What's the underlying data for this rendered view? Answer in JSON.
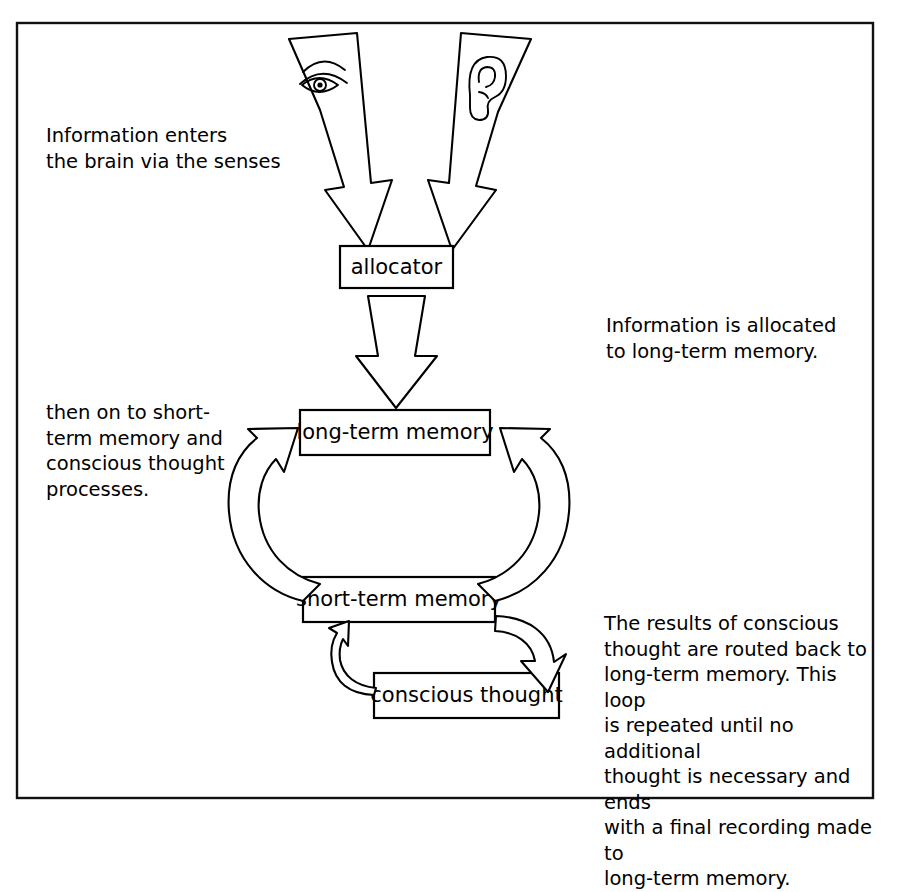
{
  "figure": {
    "border_color": "#111111",
    "background": "#ffffff",
    "ink_color": "#000000"
  },
  "nodes": [
    {
      "id": "allocator",
      "label": "allocator"
    },
    {
      "id": "long-term-memory",
      "label": "long-term memory"
    },
    {
      "id": "short-term-memory",
      "label": "short-term memory"
    },
    {
      "id": "conscious-thought",
      "label": "conscious thought"
    }
  ],
  "sense_icons": [
    {
      "id": "eye-icon",
      "name": "eye"
    },
    {
      "id": "ear-icon",
      "name": "ear"
    }
  ],
  "captions": {
    "senses": "Information enters\nthe brain via the senses",
    "allocated": "Information is allocated\nto long-term memory.",
    "short_term": "then on to short-\nterm memory and\nconscious thought\nprocesses.",
    "loop": "The results of conscious\nthought are routed back to\nlong-term memory. This loop\nis repeated until no additional\nthought is necessary and ends\nwith a final recording made to\nlong-term memory."
  },
  "flows": [
    {
      "id": "eye-to-allocator",
      "from": "eye",
      "to": "allocator"
    },
    {
      "id": "ear-to-allocator",
      "from": "ear",
      "to": "allocator"
    },
    {
      "id": "allocator-to-long-term",
      "from": "allocator",
      "to": "long-term memory"
    },
    {
      "id": "short-term-to-long-left",
      "from": "short-term memory",
      "to": "long-term memory"
    },
    {
      "id": "short-term-to-long-right",
      "from": "short-term memory",
      "to": "long-term memory"
    },
    {
      "id": "short-term-to-conscious",
      "from": "short-term memory",
      "to": "conscious thought"
    },
    {
      "id": "conscious-to-short-term",
      "from": "conscious thought",
      "to": "short-term memory"
    }
  ]
}
